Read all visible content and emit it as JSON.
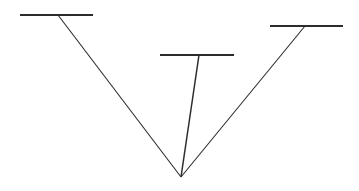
{
  "figure": {
    "background_color": "#ffffff",
    "line_color": "#2c2c2c",
    "canvas": {
      "width": 359,
      "height": 191
    },
    "vertex": {
      "label": "common-vertex",
      "x": 181,
      "y": 177
    },
    "bars": [
      {
        "name": "left-bar",
        "x1": 20,
        "y1": 15,
        "x2": 93,
        "y2": 15,
        "thickness": 2.1,
        "junction_x": 58
      },
      {
        "name": "middle-bar",
        "x1": 160,
        "y1": 55,
        "x2": 234,
        "y2": 55,
        "thickness": 2.1,
        "junction_x": 199
      },
      {
        "name": "right-bar",
        "x1": 270,
        "y1": 26,
        "x2": 343,
        "y2": 26,
        "thickness": 2.1,
        "junction_x": 305
      }
    ],
    "converging_lines": [
      {
        "name": "left-diagonal",
        "x1": 58,
        "y1": 15,
        "x2": 181,
        "y2": 177,
        "thickness": 1.1
      },
      {
        "name": "middle-stem",
        "x1": 199,
        "y1": 55,
        "x2": 181,
        "y2": 177,
        "thickness": 1.5
      },
      {
        "name": "right-diagonal",
        "x1": 305,
        "y1": 26,
        "x2": 181,
        "y2": 177,
        "thickness": 1.1
      }
    ]
  }
}
